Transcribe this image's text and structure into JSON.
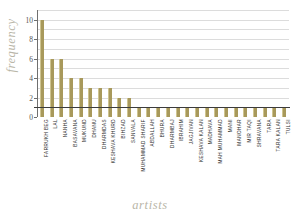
{
  "chart_data": {
    "type": "bar",
    "title": "",
    "xlabel": "artists",
    "ylabel": "frequency",
    "ylim": [
      0,
      11
    ],
    "yticks": [
      0,
      2,
      4,
      6,
      8,
      10
    ],
    "gridlines": true,
    "grid_step": 1,
    "legend": null,
    "bar_color": "#a8995b",
    "categories": [
      "FARRUKH BEG",
      "LAL",
      "NANHA",
      "BASAVANA",
      "MUKUND",
      "DHANU",
      "DHARMDAS",
      "KESHAVA KHURD",
      "BIHZAD",
      "SANVALA",
      "MUHAMMAD SHARIF",
      "ABDALLAH",
      "BHURA",
      "DHARMBAJ",
      "IBRAHIM",
      "JAGJIVAN",
      "KESHAVA KALAN",
      "MADHAVA",
      "MAH MUHAMMAD",
      "MANI",
      "MANOHAR",
      "MIR TAQI",
      "SHRAVANA",
      "TARA",
      "TARA KALAN",
      "TULSI"
    ],
    "values": [
      10,
      6,
      6,
      4,
      4,
      3,
      3,
      3,
      2,
      2,
      1,
      1,
      1,
      1,
      1,
      1,
      1,
      1,
      1,
      1,
      1,
      1,
      1,
      1,
      1,
      1
    ]
  },
  "axes": {
    "y_title": "frequency",
    "x_title": "artists"
  }
}
